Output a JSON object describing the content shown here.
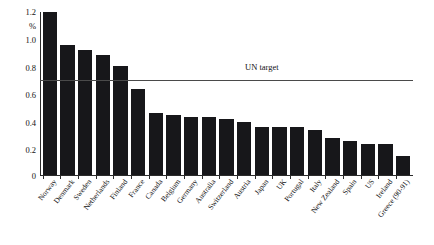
{
  "chart_data": {
    "type": "bar",
    "title": "",
    "subtitle": "",
    "xlabel": "",
    "ylabel": "%",
    "ylim": [
      0,
      1.2
    ],
    "yticks": [
      "0",
      "0.2",
      "0.4",
      "0.6",
      "0.8",
      "1.0",
      "1.2"
    ],
    "ytick_values": [
      0,
      0.2,
      0.4,
      0.6,
      0.8,
      1.0,
      1.2
    ],
    "grid": false,
    "legend": "none",
    "orientation": "vertical",
    "bar_color": "#17171a",
    "categories": [
      "Norway",
      "Denmark",
      "Sweden",
      "Netherlands",
      "Finland",
      "France",
      "Canada",
      "Belgium",
      "Germany",
      "Australia",
      "Switzerland",
      "Austria",
      "Japan",
      "UK",
      "Portugal",
      "Italy",
      "New Zealand",
      "Spain",
      "US",
      "Ireland",
      "Greece (90-91)"
    ],
    "values": [
      1.2,
      0.96,
      0.92,
      0.88,
      0.8,
      0.63,
      0.46,
      0.44,
      0.43,
      0.43,
      0.41,
      0.39,
      0.35,
      0.35,
      0.35,
      0.33,
      0.27,
      0.25,
      0.23,
      0.23,
      0.14
    ],
    "annotations": [
      {
        "label": "UN target",
        "type": "horizontal-line",
        "value": 0.7,
        "color": "#4a4a4a"
      }
    ]
  }
}
